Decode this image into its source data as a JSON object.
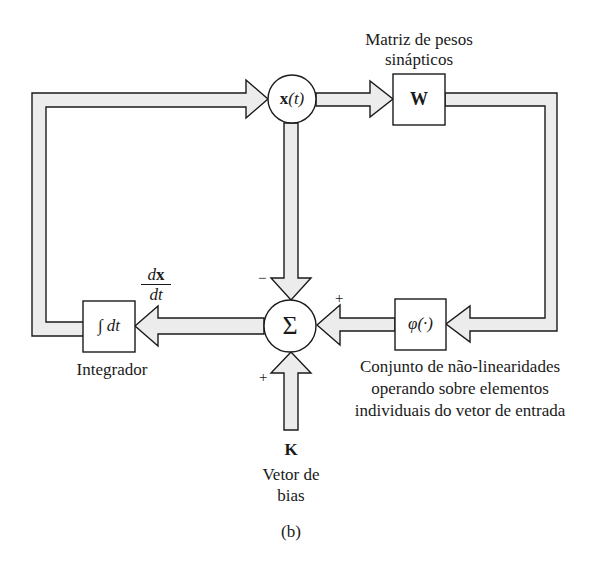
{
  "diagram": {
    "caption": "(b)",
    "nodes": {
      "state": {
        "symbol": "x",
        "arg": "(t)"
      },
      "weights": {
        "symbol": "W",
        "label_line1": "Matriz de pesos",
        "label_line2": "sinápticos"
      },
      "nonlinearity": {
        "symbol": "φ(·)",
        "label_line1": "Conjunto de não-linearidades",
        "label_line2": "operando sobre elementos",
        "label_line3": "individuais do vetor de entrada"
      },
      "summer": {
        "symbol": "Σ"
      },
      "integrator": {
        "symbol": "∫ dt",
        "label": "Integrador"
      },
      "bias": {
        "symbol": "K",
        "label_line1": "Vetor de",
        "label_line2": "bias"
      }
    },
    "derivative": {
      "numerator_d": "d",
      "numerator_x": "x",
      "denominator": "dt"
    },
    "signs": {
      "from_state": "−",
      "from_nonlinearity": "+",
      "from_bias": "+"
    },
    "colors": {
      "arrow_fill": "#ececec",
      "stroke": "#1a1a1a",
      "background": "#ffffff"
    }
  }
}
